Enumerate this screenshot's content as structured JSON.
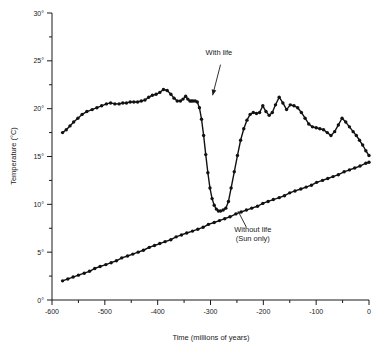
{
  "chart_data": {
    "type": "line",
    "title": "",
    "xlabel": "Time (millions of years)",
    "ylabel": "Temperature (°C)",
    "xlim": [
      -600,
      0
    ],
    "ylim": [
      0,
      30
    ],
    "grid": false,
    "legend_position": "inline-annotations",
    "x_ticks": [
      -600,
      -500,
      -400,
      -300,
      -200,
      -100,
      0
    ],
    "x_tick_labels": [
      "-600",
      "-500",
      "-400",
      "-300",
      "-200",
      "-100",
      "0"
    ],
    "x_minor_ticks": [
      -550,
      -450,
      -350,
      -250,
      -150,
      -50
    ],
    "y_ticks": [
      0,
      5,
      10,
      15,
      20,
      25,
      30
    ],
    "y_tick_labels": [
      "0°",
      "5°",
      "10°",
      "15°",
      "20°",
      "25°",
      "30°"
    ],
    "y_minor_ticks": [
      2.5,
      7.5,
      12.5,
      17.5,
      22.5,
      27.5
    ],
    "annotations": [
      {
        "name": "with-life",
        "text": "With life",
        "text_x": -284,
        "text_y": 25.6,
        "arrow_from_x": -281,
        "arrow_from_y": 24.6,
        "arrow_to_x": -296,
        "arrow_to_y": 21.4
      },
      {
        "name": "without-life",
        "text_line1": "Without life",
        "text_line2": "(Sun only)",
        "text_x": -220,
        "text_y": 7.1,
        "leader_from_x": -232,
        "leader_from_y": 7.6,
        "leader_to_x": -248,
        "leader_to_y": 9.3
      }
    ],
    "series": [
      {
        "name": "With life",
        "marker": "circle",
        "x": [
          -580,
          -573,
          -566,
          -559,
          -551,
          -543,
          -534,
          -524,
          -515,
          -506,
          -497,
          -489,
          -481,
          -473,
          -466,
          -459,
          -452,
          -445,
          -438,
          -431,
          -424,
          -417,
          -410,
          -403,
          -396,
          -389,
          -382,
          -375,
          -369,
          -363,
          -357,
          -352,
          -347,
          -343,
          -339,
          -336,
          -333,
          -329,
          -325,
          -321,
          -317,
          -313,
          -309,
          -305,
          -301,
          -297,
          -293,
          -289,
          -285,
          -281,
          -276,
          -271,
          -266,
          -261,
          -255,
          -249,
          -243,
          -237,
          -231,
          -225,
          -219,
          -213,
          -207,
          -201,
          -195,
          -189,
          -183,
          -177,
          -170,
          -163,
          -156,
          -149,
          -142,
          -135,
          -128,
          -121,
          -114,
          -107,
          -100,
          -93,
          -86,
          -79,
          -72,
          -65,
          -58,
          -51,
          -44,
          -37,
          -30,
          -24,
          -18,
          -12,
          -6,
          0
        ],
        "y": [
          17.5,
          17.8,
          18.2,
          18.6,
          19.0,
          19.4,
          19.7,
          19.9,
          20.1,
          20.3,
          20.5,
          20.6,
          20.5,
          20.5,
          20.6,
          20.6,
          20.7,
          20.7,
          20.7,
          20.8,
          20.9,
          21.2,
          21.4,
          21.5,
          21.7,
          22.0,
          21.9,
          21.5,
          21.1,
          20.8,
          20.8,
          21.0,
          21.3,
          21.0,
          20.8,
          20.8,
          20.8,
          20.8,
          20.7,
          20.1,
          18.9,
          17.2,
          15.2,
          13.3,
          11.7,
          10.6,
          9.9,
          9.5,
          9.3,
          9.3,
          9.4,
          9.6,
          10.3,
          11.7,
          13.4,
          15.1,
          16.7,
          17.9,
          18.8,
          19.4,
          19.6,
          19.5,
          19.6,
          20.3,
          19.7,
          19.3,
          19.6,
          20.4,
          21.2,
          20.6,
          19.9,
          20.4,
          20.3,
          20.1,
          19.6,
          19.0,
          18.4,
          18.1,
          18.0,
          17.9,
          17.8,
          17.5,
          17.2,
          17.6,
          18.3,
          19.0,
          18.6,
          18.1,
          17.6,
          17.2,
          16.7,
          16.2,
          15.6,
          15.1
        ]
      },
      {
        "name": "Without life (Sun only)",
        "marker": "circle",
        "x": [
          -580,
          -570,
          -560,
          -550,
          -539,
          -529,
          -519,
          -509,
          -498,
          -488,
          -478,
          -468,
          -457,
          -447,
          -437,
          -427,
          -416,
          -406,
          -396,
          -386,
          -375,
          -365,
          -355,
          -345,
          -334,
          -324,
          -314,
          -304,
          -293,
          -283,
          -273,
          -263,
          -252,
          -242,
          -232,
          -222,
          -211,
          -201,
          -191,
          -181,
          -170,
          -160,
          -150,
          -140,
          -129,
          -119,
          -109,
          -99,
          -88,
          -78,
          -68,
          -58,
          -47,
          -37,
          -27,
          -17,
          -6,
          0
        ],
        "y": [
          2.0,
          2.2,
          2.4,
          2.6,
          2.8,
          3.0,
          3.3,
          3.5,
          3.7,
          3.9,
          4.1,
          4.4,
          4.6,
          4.8,
          5.0,
          5.2,
          5.5,
          5.7,
          5.9,
          6.1,
          6.3,
          6.6,
          6.8,
          7.0,
          7.2,
          7.4,
          7.6,
          7.9,
          8.1,
          8.3,
          8.5,
          8.7,
          9.0,
          9.2,
          9.4,
          9.6,
          9.8,
          10.1,
          10.3,
          10.5,
          10.7,
          10.9,
          11.2,
          11.4,
          11.6,
          11.8,
          12.0,
          12.3,
          12.5,
          12.7,
          12.9,
          13.1,
          13.4,
          13.6,
          13.8,
          14.0,
          14.3,
          14.4
        ]
      }
    ]
  }
}
